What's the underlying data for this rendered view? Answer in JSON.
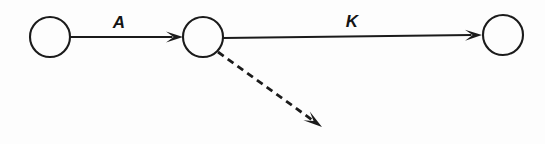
{
  "diagram": {
    "background_color": "#fdfdfd",
    "ink_color": "#1b1b1b",
    "width": 545,
    "height": 144,
    "nodes": [
      {
        "id": "n1",
        "label": "",
        "cx": 50,
        "cy": 37,
        "r": 20
      },
      {
        "id": "n2",
        "label": "",
        "cx": 203,
        "cy": 37,
        "r": 20
      },
      {
        "id": "n3",
        "label": "",
        "cx": 503,
        "cy": 35,
        "r": 20
      }
    ],
    "edges": [
      {
        "id": "e1",
        "label": "A",
        "style": "solid",
        "from": "n1",
        "to": "n2",
        "x1": 70,
        "y1": 37,
        "x2": 183,
        "y2": 37,
        "label_x": 119,
        "label_y": 28
      },
      {
        "id": "e2",
        "label": "K",
        "style": "solid",
        "from": "n2",
        "to": "n3",
        "x1": 223,
        "y1": 38,
        "x2": 482,
        "y2": 35,
        "label_x": 352,
        "label_y": 27
      },
      {
        "id": "e3",
        "label": "",
        "style": "dashed",
        "from": "n2",
        "to": "",
        "x1": 218,
        "y1": 52,
        "x2": 322,
        "y2": 127,
        "label_x": 0,
        "label_y": 0
      }
    ],
    "dash_pattern": "7 5"
  }
}
